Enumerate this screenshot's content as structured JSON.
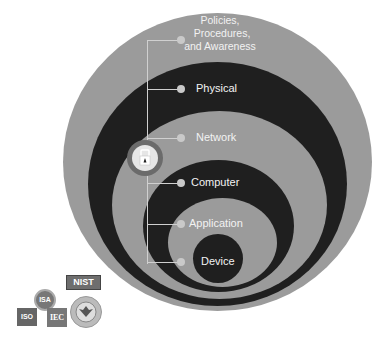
{
  "colors": {
    "gray_layer": "#9b9b9b",
    "dark_layer": "#1f1f1f",
    "white": "#ffffff",
    "lock_ring": "#6b6b6b"
  },
  "layers": [
    {
      "label_lines": [
        "Policies,",
        "Procedures,",
        "and Awareness"
      ],
      "tone": "gray"
    },
    {
      "label": "Physical",
      "tone": "dark"
    },
    {
      "label": "Network",
      "tone": "gray"
    },
    {
      "label": "Computer",
      "tone": "dark"
    },
    {
      "label": "Application",
      "tone": "gray"
    },
    {
      "label": "Device",
      "tone": "dark"
    }
  ],
  "center_icon": "padlock-icon",
  "logos": {
    "isa": "ISA",
    "iso": "ISO",
    "iec": "IEC",
    "nist": "NIST",
    "dhs": "dhs-seal-icon"
  }
}
